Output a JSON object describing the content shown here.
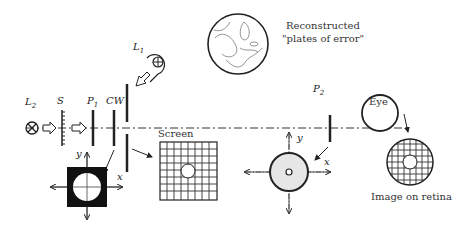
{
  "labels": {
    "L2": "L",
    "L2_sub": "2",
    "S": "S",
    "P1": "P",
    "P1_sub": "1",
    "CW": "CW",
    "L1": "L",
    "L1_sub": "1",
    "P2": "P",
    "P2_sub": "2",
    "eye": "Eye",
    "screen": "Screen",
    "reconstructed_line1": "Reconstructed",
    "reconstructed_line2": "\"plates of error\"",
    "retina": "Image on retina",
    "axis_x": "x",
    "axis_y": "y"
  },
  "colors": {
    "ink": "#222222",
    "stroke": "#1a1a1a",
    "disk_fill": "#e6e6e6"
  }
}
